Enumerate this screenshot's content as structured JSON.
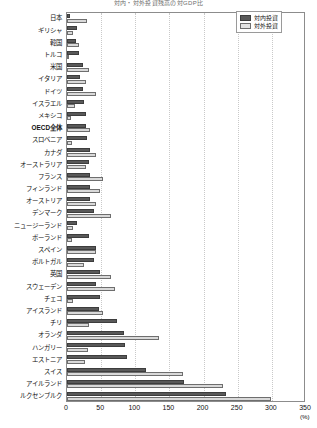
{
  "chart_data": {
    "type": "bar",
    "orientation": "horizontal",
    "title": "対内・対外投資残高の対GDP比",
    "xlabel": "(%)",
    "ylabel": "",
    "xlim": [
      0,
      350
    ],
    "xticks": [
      0,
      50,
      100,
      150,
      200,
      250,
      300,
      350
    ],
    "grid": true,
    "legend_position": "top-right",
    "categories": [
      "日本",
      "ギリシャ",
      "韓国",
      "トルコ",
      "米国",
      "イタリア",
      "ドイツ",
      "イスラエル",
      "メキシコ",
      "OECD全体",
      "スロベニア",
      "カナダ",
      "オーストラリア",
      "フランス",
      "フィンランド",
      "オーストリア",
      "デンマーク",
      "ニュージーランド",
      "ポーランド",
      "スペイン",
      "ポルトガル",
      "英国",
      "スウェーデン",
      "チェコ",
      "アイスランド",
      "チリ",
      "オランダ",
      "ハンガリー",
      "エストニア",
      "スイス",
      "アイルランド",
      "ルクセンブルク"
    ],
    "bold_categories": [
      "OECD全体"
    ],
    "series": [
      {
        "name": "対内投資",
        "color": "#595959",
        "values": [
          4,
          14,
          13,
          17,
          23,
          19,
          24,
          25,
          28,
          28,
          29,
          33,
          32,
          34,
          34,
          33,
          39,
          14,
          32,
          42,
          39,
          48,
          43,
          48,
          47,
          73,
          84,
          85,
          88,
          115,
          171,
          233
        ]
      },
      {
        "name": "対外投資",
        "color": "#d9d9d9",
        "values": [
          30,
          9,
          17,
          3,
          32,
          28,
          43,
          12,
          6,
          33,
          7,
          42,
          28,
          53,
          48,
          42,
          64,
          9,
          8,
          42,
          25,
          65,
          71,
          9,
          53,
          32,
          134,
          31,
          27,
          170,
          229,
          299
        ]
      }
    ]
  },
  "legend": {
    "items": [
      {
        "label": "対内投資",
        "key": "inward"
      },
      {
        "label": "対外投資",
        "key": "outward"
      }
    ]
  },
  "axis": {
    "unit": "(%)"
  }
}
